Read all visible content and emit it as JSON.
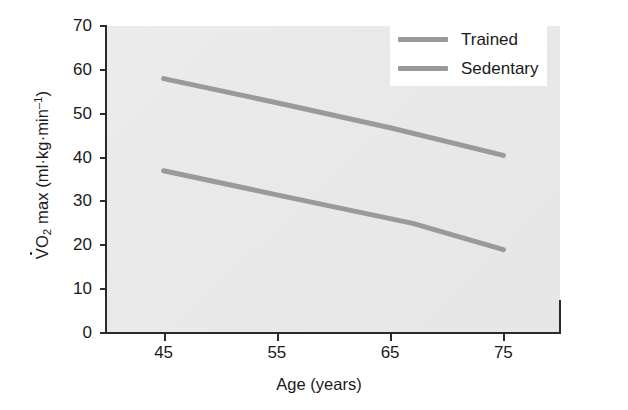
{
  "chart_data": {
    "type": "line",
    "title": "",
    "xlabel": "Age (years)",
    "ylabel": "VO2 max (ml·kg·min–1)",
    "ylabel_parts": {
      "v": "V",
      "o": "O",
      "sub": "2",
      "mid": " max (ml·kg·min",
      "sup": "–1",
      "close": ")"
    },
    "xlim": [
      40,
      80
    ],
    "ylim": [
      0,
      70
    ],
    "xticks": [
      45,
      55,
      65,
      75
    ],
    "yticks": [
      0,
      10,
      20,
      30,
      40,
      50,
      60,
      70
    ],
    "xtick_labels": [
      "45",
      "55",
      "65",
      "75"
    ],
    "ytick_labels": [
      "0",
      "10",
      "20",
      "30",
      "40",
      "50",
      "60",
      "70"
    ],
    "grid": false,
    "legend_position": "upper right",
    "plot_background": "#e9e9e9",
    "line_color": "#9a9a9a",
    "axis_color": "#2a2a2a",
    "series": [
      {
        "name": "Trained",
        "color": "#9a9a9a",
        "x": [
          45,
          55,
          65,
          75
        ],
        "values": [
          58.0,
          52.5,
          46.8,
          40.5
        ]
      },
      {
        "name": "Sedentary",
        "color": "#9a9a9a",
        "x": [
          45,
          55,
          67,
          75
        ],
        "values": [
          37.0,
          31.5,
          25.0,
          19.0
        ]
      }
    ]
  },
  "legend": {
    "items": [
      {
        "label": "Trained",
        "color": "#9a9a9a"
      },
      {
        "label": "Sedentary",
        "color": "#9a9a9a"
      }
    ]
  }
}
